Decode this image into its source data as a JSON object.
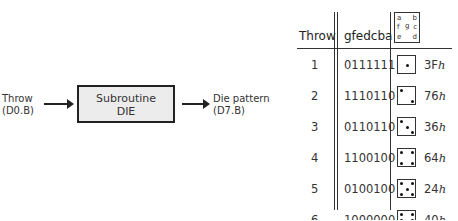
{
  "diagram": {
    "input_label": [
      "Throw",
      "(D0.B)"
    ],
    "box_label": [
      "Subroutine",
      "DIE"
    ],
    "output_label": [
      "Die pattern",
      "(D7.B)"
    ]
  },
  "table": {
    "headers": {
      "throw": "Throw",
      "bits": "gfedcba",
      "segments": [
        "a   b",
        "f g c",
        "e   d"
      ]
    },
    "rows": [
      {
        "throw": "1",
        "bits": "0111111",
        "hex": "3F",
        "suffix": "h",
        "pips": [
          [
            1,
            1
          ]
        ]
      },
      {
        "throw": "2",
        "bits": "1110110",
        "hex": "76",
        "suffix": "h",
        "pips": [
          [
            0,
            0
          ],
          [
            2,
            2
          ]
        ]
      },
      {
        "throw": "3",
        "bits": "0110110",
        "hex": "36",
        "suffix": "h",
        "pips": [
          [
            0,
            0
          ],
          [
            1,
            1
          ],
          [
            2,
            2
          ]
        ]
      },
      {
        "throw": "4",
        "bits": "1100100",
        "hex": "64",
        "suffix": "h",
        "pips": [
          [
            0,
            0
          ],
          [
            2,
            0
          ],
          [
            0,
            2
          ],
          [
            2,
            2
          ]
        ]
      },
      {
        "throw": "5",
        "bits": "0100100",
        "hex": "24",
        "suffix": "h",
        "pips": [
          [
            0,
            0
          ],
          [
            2,
            0
          ],
          [
            1,
            1
          ],
          [
            0,
            2
          ],
          [
            2,
            2
          ]
        ]
      },
      {
        "throw": "6",
        "bits": "1000000",
        "hex": "40",
        "suffix": "h",
        "pips": [
          [
            0,
            0
          ],
          [
            2,
            0
          ],
          [
            0,
            1
          ],
          [
            2,
            1
          ],
          [
            0,
            2
          ],
          [
            2,
            2
          ]
        ]
      }
    ]
  }
}
